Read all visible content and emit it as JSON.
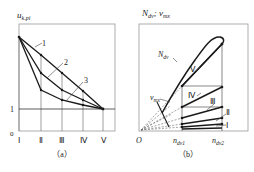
{
  "panel_a": {
    "y_axis_label_main": "u",
    "y_axis_label_sub": "k.pi",
    "origin_label": "0",
    "y_tick_one": "1",
    "x_tick_labels": [
      "Ⅰ",
      "Ⅱ",
      "Ⅲ",
      "Ⅳ",
      "Ⅴ"
    ],
    "curve_labels": [
      "1",
      "2",
      "3"
    ],
    "caption": "（a）"
  },
  "panel_b": {
    "y_axis_label": "N",
    "y_axis_label_sub": "dv",
    "y_axis_sep": "; ",
    "y_axis_label2": "v",
    "y_axis_label2_sub": "mx",
    "origin_label": "O",
    "x_tick_1": "n",
    "x_tick_1_sub": "dv1",
    "x_tick_2": "n",
    "x_tick_2_sub": "dv2",
    "curve_label_N": "N",
    "curve_label_N_sub": "dv",
    "curve_label_v": "v",
    "curve_label_v_sub": "mx",
    "gear_labels": [
      "Ⅴ",
      "Ⅳ",
      "Ⅲ",
      "Ⅱ",
      "Ⅰ"
    ],
    "caption": "（b）"
  },
  "colors": {
    "line": "#1a1a1a",
    "frame": "#888888",
    "grid": "#777777"
  }
}
